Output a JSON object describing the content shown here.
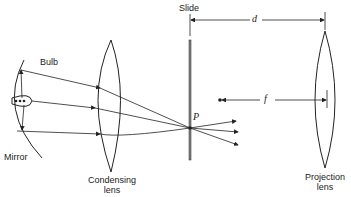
{
  "diagram": {
    "type": "optics-schematic",
    "labels": {
      "bulb": "Bulb",
      "mirror": "Mirror",
      "condensing_lens": "Condensing\nlens",
      "condensing_lens_line1": "Condensing",
      "condensing_lens_line2": "lens",
      "slide": "Slide",
      "projection_lens_line1": "Projection",
      "projection_lens_line2": "lens",
      "point": "P",
      "distance_d": "d",
      "focal_length": "f"
    },
    "components": [
      "Mirror",
      "Bulb",
      "Condensing lens",
      "Slide",
      "Projection lens"
    ],
    "rays": "Light from bulb (direct and mirror-reflected) converges through the condensing lens to point P on the slide, then diverges",
    "colors": {
      "stroke": "#222222",
      "background": "#ffffff"
    }
  }
}
